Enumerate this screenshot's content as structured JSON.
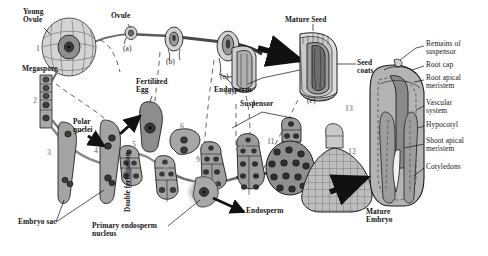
{
  "figure": {
    "background_color": "#ffffff",
    "ink_color": "#151515",
    "tissue_fill": "#9a9a9a",
    "number_color": "#9a9a9a"
  },
  "labels": {
    "young_ovule": "Young\nOvule",
    "megaspore": "Megaspore",
    "ovule": "Ovule",
    "polar_nuclei": "Polar\nnuclei",
    "double_fertilization": "Double fertilization",
    "fertilized_egg": "Fertilized\nEgg",
    "embryo_sac": "Embryo sac",
    "primary_endosperm_nucleus": "Primary endosperm\nnucleus",
    "endosperm_bottom": "Endosperm",
    "endosperm_top": "Endosperm",
    "suspensor": "Suspensor",
    "mature_seed": "Mature Seed",
    "seed_coats": "Seed\ncoats",
    "mature_embryo": "Mature\nEmbryo"
  },
  "stage_letters": [
    {
      "id": "a",
      "text": "(a)"
    },
    {
      "id": "b",
      "text": "(b)"
    },
    {
      "id": "c",
      "text": "(c)"
    },
    {
      "id": "d",
      "text": "(d)"
    },
    {
      "id": "e",
      "text": "(e)"
    }
  ],
  "stage_numbers": [
    {
      "id": "n1",
      "text": "1"
    },
    {
      "id": "n2",
      "text": "2"
    },
    {
      "id": "n3",
      "text": "3"
    },
    {
      "id": "n4",
      "text": "4"
    },
    {
      "id": "n5",
      "text": "5"
    },
    {
      "id": "n6",
      "text": "6"
    },
    {
      "id": "n7",
      "text": "7"
    },
    {
      "id": "n8",
      "text": "8"
    },
    {
      "id": "n9",
      "text": "9"
    },
    {
      "id": "n10",
      "text": "10"
    },
    {
      "id": "n11",
      "text": "11"
    },
    {
      "id": "n12",
      "text": "12"
    },
    {
      "id": "n13",
      "text": "13"
    }
  ],
  "callouts": [
    {
      "id": "remains-of-suspensor",
      "text": "Remains of\nsuspensor"
    },
    {
      "id": "root-cap",
      "text": "Root cap"
    },
    {
      "id": "root-apical-meristem",
      "text": "Root apical\nmeristem"
    },
    {
      "id": "vascular-system",
      "text": "Vascular\nsystem"
    },
    {
      "id": "hypocotyl",
      "text": "Hypocotyl"
    },
    {
      "id": "shoot-apical-meristem",
      "text": "Shoot apical\nmeristem"
    },
    {
      "id": "cotyledons",
      "text": "Cotyledons"
    }
  ]
}
